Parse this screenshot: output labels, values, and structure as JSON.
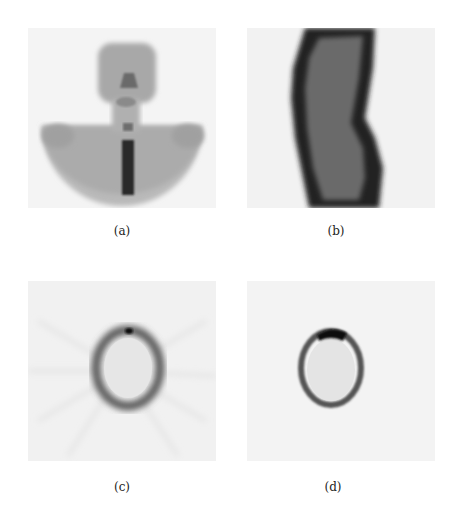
{
  "figure": {
    "panels": [
      {
        "id": "a",
        "caption": "(a)",
        "description": "Anterior bone scintigraphy of head, neck and upper thorax; dark vertical spine uptake"
      },
      {
        "id": "b",
        "caption": "(b)",
        "description": "Lateral scintigraphic view of body contour with dark outer rim"
      },
      {
        "id": "c",
        "caption": "(c)",
        "description": "Transaxial slice showing blurred elliptical ring with streak artifacts"
      },
      {
        "id": "d",
        "caption": "(d)",
        "description": "Reconstructed transaxial slice showing sharper elliptical ring with dark spot at top"
      }
    ],
    "colors": {
      "background": "#ffffff",
      "panel_bg": "#f3f3f3",
      "uptake_dark": "#1a1a1a",
      "uptake_mid": "#777777"
    }
  }
}
